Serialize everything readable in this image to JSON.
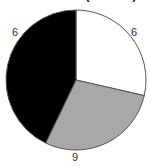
{
  "figure": {
    "width": 150,
    "height": 166,
    "background": "#ffffff",
    "title": "in this form (100.0%)",
    "title_clipped": true
  },
  "labels": {
    "left": "6",
    "right": "6",
    "bottom": "9"
  },
  "chart_data": {
    "type": "pie",
    "title": "in this form (100.0%)",
    "categories": [
      "Slice 1",
      "Slice 2",
      "Slice 3"
    ],
    "values": [
      6,
      6,
      9
    ],
    "total": 21,
    "data_labels": [
      "6",
      "6",
      "9"
    ],
    "label_positions": [
      "upper-left",
      "upper-right",
      "bottom"
    ],
    "colors": [
      "#ffffff",
      "#a8a8a8",
      "#000000"
    ],
    "start_angle_deg": 0,
    "direction": "clockwise",
    "slice_angles_deg": [
      102.9,
      102.9,
      154.3
    ],
    "stroke": "#555555",
    "stroke_width": 1,
    "legend": "none",
    "grid": false,
    "center": [
      76,
      80
    ],
    "radius": 70
  }
}
